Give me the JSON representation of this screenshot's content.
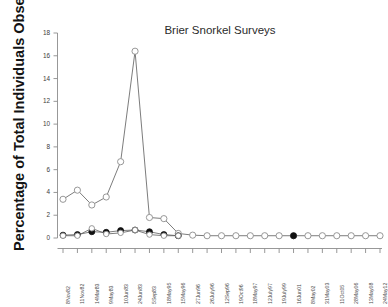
{
  "chart_data": {
    "type": "line",
    "title": "Brier Snorkel Surveys",
    "xlabel": "",
    "ylabel": "Percentage of Total Individuals Observed",
    "ylim": [
      0,
      18
    ],
    "yticks": [
      0,
      2,
      4,
      6,
      8,
      10,
      12,
      14,
      16,
      18
    ],
    "ytick_labels": [
      "0",
      "2",
      "4",
      "6",
      "8",
      "10",
      "12",
      "14",
      "16",
      "18"
    ],
    "grid": false,
    "legend": "none",
    "categories": [
      "8Nov82",
      "11Nov82",
      "14Mar83",
      "9May83",
      "10Jun83",
      "24Jun83",
      "5Sep83",
      "18May95",
      "15May96",
      "27Jun96",
      "26July96",
      "12Sep96",
      "19Oct96",
      "18May97",
      "12July97",
      "19July99",
      "16Jun01",
      "8May02",
      "31May03",
      "11Oct05",
      "28May06",
      "13May08",
      "24May12"
    ],
    "series": [
      {
        "name": "open-circle-series",
        "marker": "open-circle",
        "color": "#8c8c8c",
        "values": [
          3.4,
          4.2,
          2.9,
          3.6,
          6.7,
          16.4,
          1.8,
          1.7,
          0.4,
          0.25,
          0.2,
          0.2,
          0.2,
          0.2,
          0.2,
          0.2,
          0.2,
          0.2,
          0.2,
          0.2,
          0.2,
          0.2,
          0.2
        ]
      },
      {
        "name": "filled-circle-series",
        "marker": "filled-circle",
        "color": "#111111",
        "values": [
          0.25,
          0.3,
          0.55,
          0.5,
          0.65,
          0.7,
          0.55,
          0.3,
          0.2,
          null,
          null,
          null,
          null,
          null,
          null,
          null,
          0.2,
          null,
          null,
          null,
          null,
          null,
          null
        ]
      },
      {
        "name": "open-overlay-series",
        "marker": "open-circle-small",
        "color": "#8c8c8c",
        "values": [
          0.2,
          0.2,
          0.85,
          0.35,
          0.45,
          0.7,
          0.3,
          0.2,
          0.2,
          null,
          null,
          null,
          null,
          null,
          null,
          null,
          null,
          null,
          null,
          null,
          null,
          null,
          null
        ]
      }
    ]
  }
}
